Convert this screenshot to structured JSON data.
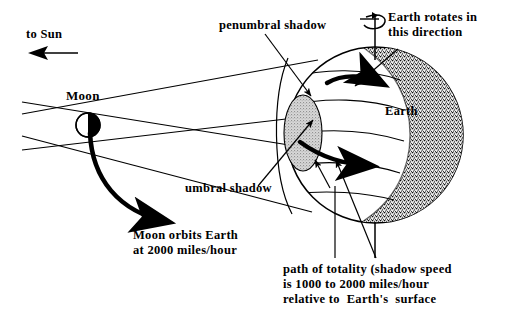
{
  "diagram": {
    "labels": {
      "to_sun": "to Sun",
      "moon": "Moon",
      "penumbral_shadow": "penumbral shadow",
      "umbral_shadow": "umbral shadow",
      "earth_rotates": "Earth rotates in\nthis direction",
      "earth": "Earth",
      "moon_orbits": "Moon orbits Earth\nat 2000 miles/hour",
      "path_of_totality": "path of totality (shadow speed\nis 1000 to 2000 miles/hour\nrelative to  Earth's  surface"
    },
    "icons": {
      "to_sun_arrow": "left-arrow-icon",
      "rotation_axis": "rotation-axis-icon",
      "moon_orbit_arrow": "curved-arrow-icon",
      "rotation_arrow_north": "curved-arrow-icon",
      "rotation_arrow_equator": "curved-arrow-icon",
      "penumbra_pointer": "leader-arrow-icon",
      "umbra_pointer": "leader-arrow-icon",
      "totality_pointer": "leader-line-icon"
    },
    "colors": {
      "ink": "#000000",
      "paper": "#ffffff",
      "umbra_fill": "#b4b4b4",
      "night_side_stipple": "#000000"
    },
    "geometry": {
      "earth_center_x": 375,
      "earth_center_y": 135,
      "earth_radius": 88,
      "moon_center_x": 88,
      "moon_center_y": 125,
      "moon_radius": 12,
      "umbra_ellipse_cx": 303,
      "umbra_ellipse_cy": 133,
      "umbra_ellipse_rx": 19,
      "umbra_ellipse_ry": 38
    }
  }
}
